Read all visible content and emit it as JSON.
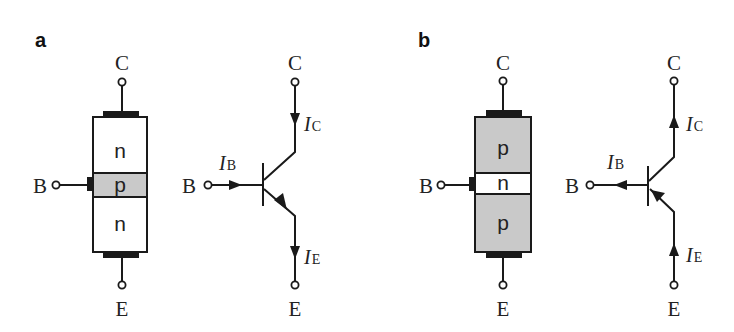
{
  "colors": {
    "line": "#1a1a1a",
    "shaded_region": "#c9c9c9",
    "unshaded_region": "#ffffff",
    "background": "#ffffff"
  },
  "panels": [
    {
      "id": "a",
      "label": "a",
      "type": "npn",
      "structure": {
        "regions": [
          {
            "label": "n",
            "shaded": false
          },
          {
            "label": "p",
            "shaded": true
          },
          {
            "label": "n",
            "shaded": false
          }
        ]
      },
      "terminals": {
        "collector": "C",
        "base": "B",
        "emitter": "E"
      },
      "symbol": {
        "terminals": {
          "collector": "C",
          "base": "B",
          "emitter": "E"
        },
        "currents": [
          {
            "name": "I",
            "sub": "B",
            "direction": "into-base"
          },
          {
            "name": "I",
            "sub": "C",
            "direction": "into-collector"
          },
          {
            "name": "I",
            "sub": "E",
            "direction": "out-of-emitter"
          }
        ]
      }
    },
    {
      "id": "b",
      "label": "b",
      "type": "pnp",
      "structure": {
        "regions": [
          {
            "label": "p",
            "shaded": true
          },
          {
            "label": "n",
            "shaded": false
          },
          {
            "label": "p",
            "shaded": true
          }
        ]
      },
      "terminals": {
        "collector": "C",
        "base": "B",
        "emitter": "E"
      },
      "symbol": {
        "terminals": {
          "collector": "C",
          "base": "B",
          "emitter": "E"
        },
        "currents": [
          {
            "name": "I",
            "sub": "B",
            "direction": "out-of-base"
          },
          {
            "name": "I",
            "sub": "C",
            "direction": "out-of-collector"
          },
          {
            "name": "I",
            "sub": "E",
            "direction": "into-emitter"
          }
        ]
      }
    }
  ]
}
